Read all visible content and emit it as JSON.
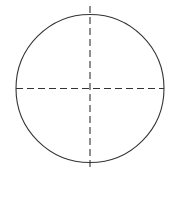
{
  "figure": {
    "title": "",
    "background_color": "#ffffff",
    "width": 172,
    "height": 205
  },
  "chart_data": {
    "type": "diagram",
    "title": "",
    "subtitle": "",
    "xlabel": "",
    "ylabel": "",
    "legend": [],
    "annotations": [],
    "grid": false,
    "shapes": [
      {
        "name": "circle-outline",
        "kind": "circle",
        "center_x": 90,
        "center_y": 88.5,
        "radius": 74,
        "stroke_color": "#333333",
        "stroke_width": 1.1,
        "stroke_style": "solid",
        "fill": "none"
      },
      {
        "name": "horizontal-axis-dashed",
        "kind": "line",
        "x1": 16,
        "y1": 88.5,
        "x2": 164,
        "y2": 88.5,
        "stroke_color": "#333333",
        "stroke_width": 1.1,
        "stroke_style": "dashed",
        "dash_length": 7,
        "dash_gap": 4
      },
      {
        "name": "vertical-axis-dashed",
        "kind": "line",
        "x1": 90,
        "y1": 6,
        "x2": 90,
        "y2": 170,
        "stroke_color": "#333333",
        "stroke_width": 1.1,
        "stroke_style": "dashed",
        "dash_length": 7,
        "dash_gap": 4
      }
    ]
  }
}
